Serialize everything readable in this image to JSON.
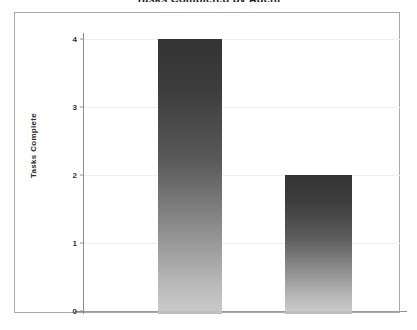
{
  "chart_data": {
    "type": "bar",
    "title": "Tasks Completed by Agent",
    "xlabel": "",
    "ylabel": "Tasks Complete",
    "categories": [
      "",
      ""
    ],
    "values": [
      4,
      2
    ],
    "ylim": [
      0,
      4
    ],
    "y_ticks": [
      "4",
      "3",
      "2",
      "1",
      "0"
    ],
    "y_tick_values": [
      4,
      3,
      2,
      1,
      0
    ],
    "grid": true,
    "legend": false,
    "legend_position": "none",
    "series": [
      {
        "name": "Tasks Complete",
        "values": [
          4,
          2
        ]
      }
    ],
    "annotations": []
  },
  "figure": {
    "title_cropped": "Tasks Completed by Agent",
    "border_color": "#a8a8a8",
    "grid_color": "#efefef",
    "axis_color": "#8d8d8d",
    "bar_gradient_top": "#343434",
    "bar_gradient_bottom": "#c9c9c9",
    "background": "#ffffff"
  },
  "axes": {
    "y_title": "Tasks Complete",
    "ticks": [
      {
        "label": "4",
        "value": 4
      },
      {
        "label": "3",
        "value": 3
      },
      {
        "label": "2",
        "value": 2
      },
      {
        "label": "1",
        "value": 1
      },
      {
        "label": "0",
        "value": 0
      }
    ]
  },
  "bars": [
    {
      "label": "",
      "value": 4,
      "left_pct": 23.3,
      "width_pct": 20.2
    },
    {
      "label": "",
      "value": 2,
      "left_pct": 63.4,
      "width_pct": 21.1
    }
  ]
}
